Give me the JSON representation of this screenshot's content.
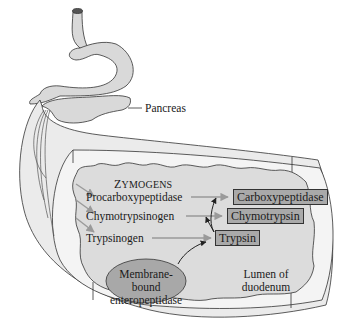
{
  "figure": {
    "organs": {
      "pancreas_label": "Pancreas",
      "lumen_label_line1": "Lumen of",
      "lumen_label_line2": "duodenum"
    },
    "zymogens": {
      "heading_initial": "Z",
      "heading_rest": "YMOGENS",
      "items": [
        "Procarboxypeptidase",
        "Chymotrypsinogen",
        "Trypsinogen"
      ]
    },
    "enzymes": [
      "Carboxypeptidase",
      "Chymotrypsin",
      "Trypsin"
    ],
    "activator": {
      "line1": "Membrane-bound",
      "line2": "enteropeptidase"
    },
    "colors": {
      "organ_fill": "#d9d9d9",
      "lumen_fill": "#e6e6e6",
      "enzyme_box": "#a9a9a9",
      "ellipse_fill": "#a8a8a8",
      "arrow_gray": "#9a9a9a",
      "arrow_dark": "#222222"
    }
  }
}
